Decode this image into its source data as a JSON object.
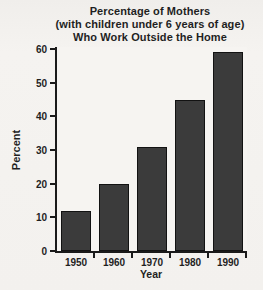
{
  "chart_data": {
    "type": "bar",
    "title": "Percentage of Mothers (with children under 6 years of age) Who Work Outside the Home",
    "title_lines": [
      "Percentage of Mothers",
      "(with children under 6 years of age)",
      "Who Work Outside the Home"
    ],
    "categories": [
      "1950",
      "1960",
      "1970",
      "1980",
      "1990"
    ],
    "values": [
      12,
      20,
      31,
      45,
      59
    ],
    "xlabel": "Year",
    "ylabel": "Percent",
    "ylim": [
      0,
      60
    ],
    "yticks": [
      0,
      10,
      20,
      30,
      40,
      50,
      60
    ],
    "grid": false,
    "legend": "none",
    "colors": {
      "bar": "#3b3b3b",
      "bar_border": "#121212",
      "axis": "#1a1a1a",
      "text": "#1f1f1f",
      "background": "#f3f1ee"
    }
  }
}
